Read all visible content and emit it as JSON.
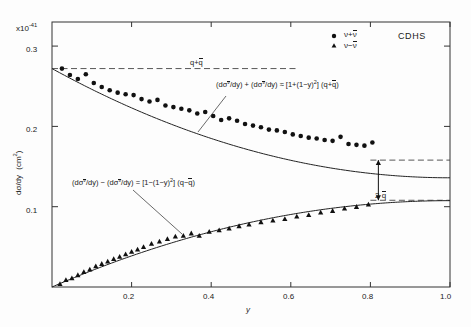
{
  "figure": {
    "experiment": "CDHS",
    "exponent_label": "x10",
    "exponent_sup": "-41",
    "y_axis_label": "dσ/dy",
    "y_axis_units": "(cm",
    "y_axis_units_sup": "2",
    "y_axis_units_close": ")",
    "x_axis_label": "y"
  },
  "legend": {
    "entries": [
      {
        "marker": "circle",
        "label_pre": "ν+",
        "label_bar": "ν"
      },
      {
        "marker": "triangle",
        "label_pre": "ν−",
        "label_bar": "ν"
      }
    ]
  },
  "annotations": {
    "dashed_line": {
      "pre": "q+",
      "bar": "q"
    },
    "sum_equation": {
      "part1": "(dσ",
      "sup1": "ν",
      "part2": "/dy) + (dσ",
      "sup2": "ν",
      "part3": "/dy) ≈ [1+(1−y)",
      "sup3": "2",
      "part4": "]  (q+",
      "bar4": "q",
      "part5": ")"
    },
    "diff_equation": {
      "part1": "(dσ",
      "sup1": "ν",
      "part2": "/dy) − (dσ",
      "sup2": "ν",
      "part3": "/dy) = [1−(1−y)",
      "sup3": "2",
      "part4": "]  (q−",
      "bar4": "q",
      "part5": ")"
    },
    "gap_label": {
      "pre": "2 ",
      "bar": "q"
    }
  },
  "chart_data": {
    "type": "scatter",
    "title": "",
    "xlabel": "y",
    "ylabel": "dσ/dy (cm^2)",
    "y_scale_factor": "1e-41",
    "xlim": [
      0.0,
      1.0
    ],
    "ylim": [
      0.0,
      0.33
    ],
    "grid": false,
    "legend_position": "top-center",
    "xticks": [
      0.2,
      0.4,
      0.6,
      0.8,
      1.0
    ],
    "xtick_labels": [
      "0.2",
      "0.4",
      "0.6",
      "0.8",
      "1.0"
    ],
    "yticks": [
      0.1,
      0.2,
      0.3
    ],
    "ytick_labels": [
      "0.1",
      "0.2",
      "0.3"
    ],
    "reference_lines": [
      {
        "name": "q+qbar",
        "type": "horizontal-dashed",
        "y": 0.272,
        "x_from": 0.0,
        "x_to": 0.62,
        "label": "q+qbar"
      },
      {
        "name": "qbar-upper-asymptote",
        "type": "horizontal-dashed",
        "y": 0.158,
        "x_from": 0.8,
        "x_to": 1.0
      },
      {
        "name": "qbar-lower-asymptote",
        "type": "horizontal-dashed",
        "y": 0.108,
        "x_from": 0.8,
        "x_to": 1.0
      }
    ],
    "series": [
      {
        "name": "nu+nubar",
        "marker": "circle",
        "x": [
          0.025,
          0.045,
          0.065,
          0.085,
          0.105,
          0.125,
          0.145,
          0.165,
          0.185,
          0.205,
          0.225,
          0.245,
          0.265,
          0.285,
          0.305,
          0.325,
          0.345,
          0.365,
          0.385,
          0.405,
          0.425,
          0.445,
          0.465,
          0.485,
          0.505,
          0.525,
          0.545,
          0.565,
          0.585,
          0.605,
          0.625,
          0.645,
          0.665,
          0.685,
          0.705,
          0.725,
          0.745,
          0.765,
          0.785,
          0.805
        ],
        "y": [
          0.272,
          0.264,
          0.259,
          0.265,
          0.254,
          0.249,
          0.245,
          0.242,
          0.24,
          0.239,
          0.234,
          0.231,
          0.233,
          0.226,
          0.224,
          0.222,
          0.22,
          0.216,
          0.218,
          0.213,
          0.208,
          0.21,
          0.207,
          0.203,
          0.201,
          0.199,
          0.196,
          0.195,
          0.193,
          0.19,
          0.188,
          0.186,
          0.185,
          0.183,
          0.182,
          0.187,
          0.178,
          0.177,
          0.176,
          0.18
        ],
        "fit_curve": "1+(1-y)^2 scaled: q+qbar"
      },
      {
        "name": "nu-nubar",
        "marker": "triangle",
        "x": [
          0.02,
          0.035,
          0.05,
          0.065,
          0.08,
          0.095,
          0.11,
          0.125,
          0.14,
          0.155,
          0.17,
          0.185,
          0.2,
          0.215,
          0.23,
          0.25,
          0.27,
          0.29,
          0.31,
          0.33,
          0.35,
          0.37,
          0.395,
          0.42,
          0.445,
          0.47,
          0.495,
          0.525,
          0.555,
          0.585,
          0.615,
          0.645,
          0.675,
          0.705,
          0.735,
          0.765,
          0.795
        ],
        "y": [
          0.004,
          0.009,
          0.011,
          0.015,
          0.019,
          0.022,
          0.026,
          0.029,
          0.032,
          0.035,
          0.038,
          0.041,
          0.044,
          0.047,
          0.05,
          0.054,
          0.057,
          0.06,
          0.063,
          0.064,
          0.067,
          0.064,
          0.069,
          0.071,
          0.073,
          0.076,
          0.078,
          0.081,
          0.083,
          0.085,
          0.088,
          0.09,
          0.093,
          0.095,
          0.098,
          0.1,
          0.103
        ],
        "fit_curve": "1-(1-y)^2 scaled: q-qbar"
      }
    ],
    "gap_marker": {
      "x": 0.82,
      "y_top": 0.158,
      "y_bottom": 0.108,
      "label": "2 qbar"
    }
  }
}
